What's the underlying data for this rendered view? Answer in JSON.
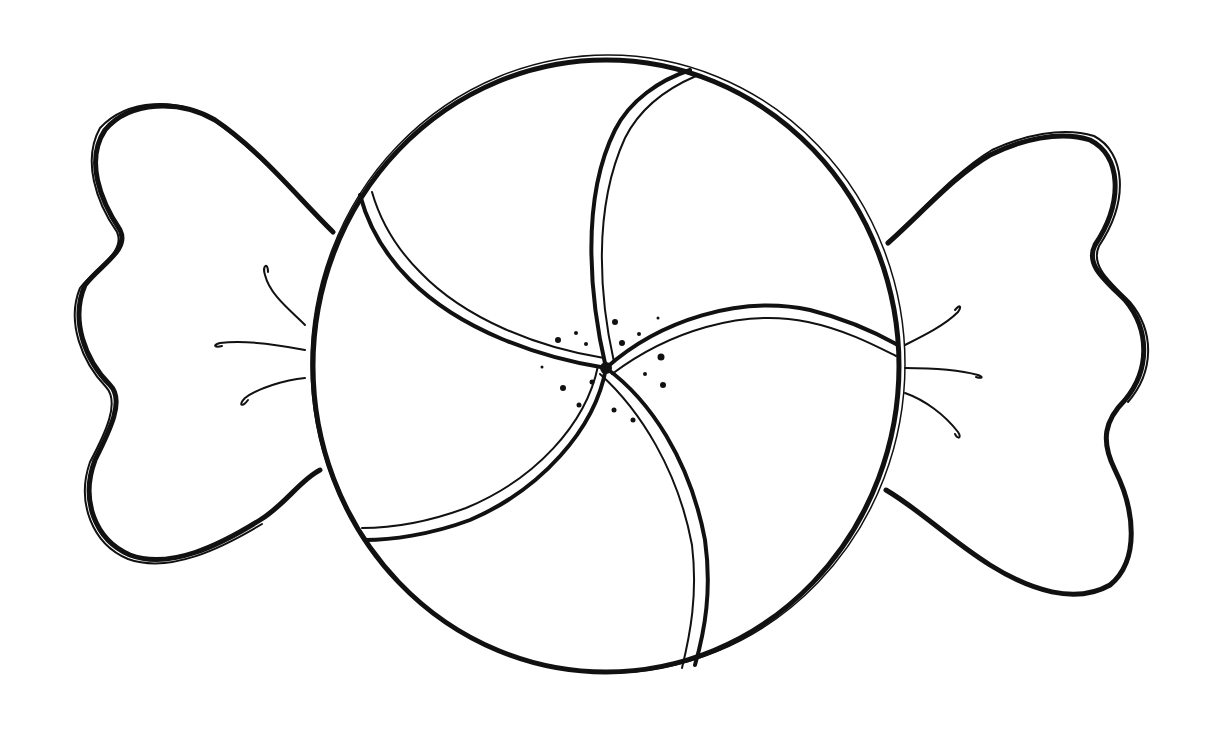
{
  "illustration": {
    "subject": "wrapped peppermint candy line drawing",
    "stroke_color": "#111111",
    "background_color": "#ffffff",
    "parts": [
      "left-wrapper",
      "candy-body",
      "swirl-stripes",
      "center-dots",
      "right-wrapper"
    ]
  }
}
